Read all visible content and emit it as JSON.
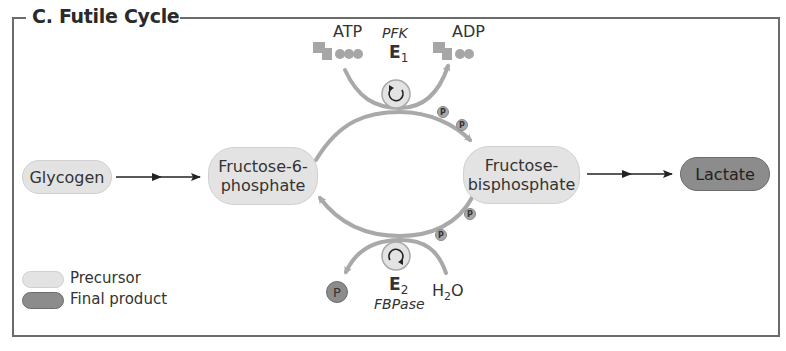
{
  "title": "C. Futile Cycle",
  "nodes": {
    "glycogen": "Glycogen",
    "f6p_line1": "Fructose-6-",
    "f6p_line2": "phosphate",
    "fbp_line1": "Fructose-",
    "fbp_line2": "bisphosphate",
    "lactate": "Lactate"
  },
  "top_reaction": {
    "substrate": "ATP",
    "product": "ADP",
    "enzyme_name": "PFK",
    "enzyme_label": "E",
    "enzyme_sub": "1"
  },
  "bottom_reaction": {
    "substrate_main": "H",
    "substrate_sub": "2",
    "substrate_tail": "O",
    "product": "P",
    "enzyme_name": "FBPase",
    "enzyme_label": "E",
    "enzyme_sub": "2"
  },
  "phosphate_label": "P",
  "legend": [
    {
      "label": "Precursor",
      "color": "#e3e3e3"
    },
    {
      "label": "Final product",
      "color": "#8c8c8c"
    }
  ],
  "colors": {
    "arc": "#a9a9a9",
    "precursor": "#e3e3e3",
    "final_product": "#8c8c8c",
    "frame": "#6b6b6b"
  }
}
